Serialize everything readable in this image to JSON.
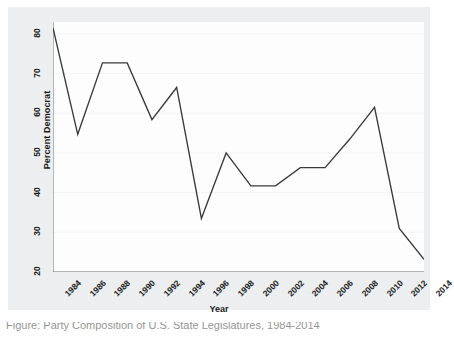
{
  "chart_data": {
    "type": "line",
    "title": "",
    "xlabel": "Year",
    "ylabel": "Percent Democrat",
    "x": [
      1984,
      1986,
      1988,
      1990,
      1992,
      1994,
      1996,
      1998,
      2000,
      2002,
      2004,
      2006,
      2008,
      2010,
      2012,
      2014
    ],
    "values": [
      81.5,
      54.7,
      72.7,
      72.7,
      58.4,
      66.5,
      33.5,
      50.0,
      41.7,
      41.7,
      46.3,
      46.3,
      53.5,
      61.5,
      31.0,
      23.2
    ],
    "series": [
      {
        "name": "Percent Democrat",
        "values": [
          81.5,
          54.7,
          72.7,
          72.7,
          58.4,
          66.5,
          33.5,
          50.0,
          41.7,
          41.7,
          46.3,
          46.3,
          53.5,
          61.5,
          31.0,
          23.2
        ]
      }
    ],
    "xlim": [
      1984,
      2014
    ],
    "ylim": [
      20,
      83
    ],
    "x_ticks": [
      1984,
      1986,
      1988,
      1990,
      1992,
      1994,
      1996,
      1998,
      2000,
      2002,
      2004,
      2006,
      2008,
      2010,
      2012,
      2014
    ],
    "x_tick_labels": [
      "1984",
      "1986",
      "1988",
      "1990",
      "1992",
      "1994",
      "1996",
      "1998",
      "2000",
      "2002",
      "2004",
      "2006",
      "2008",
      "2010",
      "2012",
      "2014"
    ],
    "y_ticks": [
      20,
      30,
      40,
      50,
      60,
      70,
      80
    ],
    "y_tick_labels": [
      "20",
      "30",
      "40",
      "50",
      "60",
      "70",
      "80"
    ],
    "grid": "horizontal",
    "legend": "none",
    "line_color": "#3a3a3a",
    "plot_background": "#fdfdfd",
    "graph_background": "#eceef0",
    "grid_color": "#f2f4f6"
  },
  "caption": {
    "text": "Figure: Party Composition of U.S. State Legislatures, 1984-2014"
  }
}
